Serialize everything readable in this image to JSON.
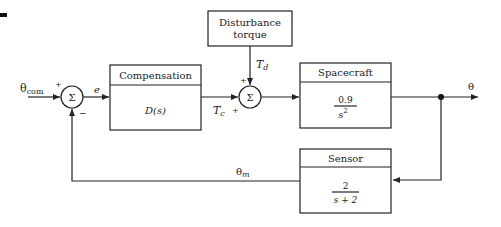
{
  "diagram": {
    "type": "feedback-block-diagram",
    "input": {
      "label": "θ",
      "subscript": "com",
      "sign": "+"
    },
    "error_signal": "e",
    "summing_junction_1": {
      "symbol": "Σ",
      "signs": [
        "+",
        "−"
      ]
    },
    "compensation": {
      "title": "Compensation",
      "transfer_function": "D(s)"
    },
    "control_torque": {
      "label": "T",
      "subscript": "c",
      "sign": "+"
    },
    "disturbance": {
      "title_line1": "Disturbance",
      "title_line2": "torque",
      "signal": "T",
      "signal_subscript": "d",
      "sign": "+"
    },
    "summing_junction_2": {
      "symbol": "Σ"
    },
    "spacecraft": {
      "title": "Spacecraft",
      "numerator": "0.9",
      "denominator": "s",
      "denominator_exponent": "2"
    },
    "output": {
      "label": "θ"
    },
    "sensor": {
      "title": "Sensor",
      "numerator": "2",
      "denominator": "s + 2"
    },
    "measured_signal": {
      "label": "θ",
      "subscript": "m"
    }
  },
  "colors": {
    "line": "#222222",
    "background": "#ffffff"
  }
}
